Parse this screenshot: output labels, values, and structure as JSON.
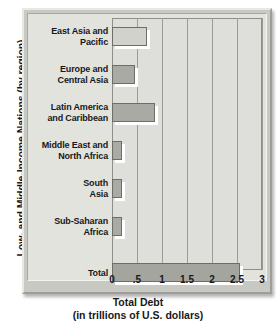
{
  "chart_data": {
    "type": "bar",
    "orientation": "horizontal",
    "title": "",
    "xlabel_line1": "Total Debt",
    "xlabel_line2": "(in trillions of U.S. dollars)",
    "ylabel": "Low- and Middle-Income Nations (by region)",
    "categories": [
      "East Asia and Pacific",
      "Europe and Central Asia",
      "Latin America and Caribbean",
      "Middle East and North Africa",
      "South Asia",
      "Sub-Saharan Africa",
      "Total"
    ],
    "category_lines": [
      [
        "East Asia and",
        "Pacific"
      ],
      [
        "Europe and",
        "Central Asia"
      ],
      [
        "Latin America",
        "and Caribbean"
      ],
      [
        "Middle East and",
        "North Africa"
      ],
      [
        "South",
        "Asia"
      ],
      [
        "Sub-Saharan",
        "Africa"
      ],
      [
        "Total"
      ]
    ],
    "values": [
      0.7,
      0.45,
      0.85,
      0.2,
      0.2,
      0.2,
      2.55
    ],
    "xlim": [
      0,
      3
    ],
    "xticks": [
      0,
      0.5,
      1,
      1.5,
      2,
      2.5,
      3
    ],
    "xtick_labels": [
      "0",
      ".5",
      "1",
      "1.5",
      "2",
      "2.5",
      "3"
    ],
    "grid": true,
    "legend": "none",
    "bar_color": "#aaaaa5",
    "bar_color_light": "#d2d2cd",
    "plot_bg": "#dededa",
    "frame_bg": "#c9c9c4",
    "gridline_color": "#9c9c97"
  }
}
